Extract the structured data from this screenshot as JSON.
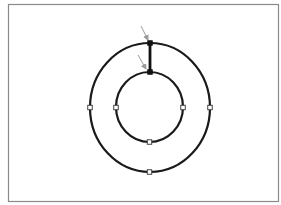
{
  "canvas": {
    "width": 281,
    "height": 205,
    "background": "#ffffff"
  },
  "frame": {
    "x": 8.5,
    "y": 4.5,
    "width": 270,
    "height": 197,
    "stroke": "#8a8a8a",
    "stroke_width": 1.2
  },
  "shapes": {
    "outer_circle": {
      "cx": 150,
      "cy": 107.5,
      "rx": 60,
      "ry": 64.5,
      "stroke": "#1a1a1a",
      "stroke_width": 2.2
    },
    "inner_circle": {
      "cx": 149.5,
      "cy": 107,
      "rx": 33.5,
      "ry": 35,
      "stroke": "#1a1a1a",
      "stroke_width": 2.2
    },
    "connector": {
      "x1": 150,
      "y1": 43,
      "x2": 150,
      "y2": 72,
      "stroke": "#111111",
      "stroke_width": 2.8
    }
  },
  "handles": {
    "size": 4.5,
    "fill": "#ffffff",
    "stroke": "#333333",
    "open": [
      {
        "name": "outer-left-handle",
        "x": 90,
        "y": 107.5
      },
      {
        "name": "outer-right-handle",
        "x": 210,
        "y": 107.5
      },
      {
        "name": "outer-bottom-handle",
        "x": 149.5,
        "y": 172
      },
      {
        "name": "inner-left-handle",
        "x": 116,
        "y": 107.5
      },
      {
        "name": "inner-right-handle",
        "x": 183,
        "y": 107.5
      },
      {
        "name": "inner-bottom-handle",
        "x": 149.5,
        "y": 142
      }
    ],
    "selected": [
      {
        "name": "outer-top-handle",
        "x": 150,
        "y": 43
      },
      {
        "name": "inner-top-handle",
        "x": 150,
        "y": 72
      }
    ],
    "selected_fill": "#111111"
  },
  "arrows": {
    "stroke": "#9a9a9a",
    "stroke_width": 1,
    "items": [
      {
        "name": "outer-top-pointer-arrow",
        "x1": 141,
        "y1": 26,
        "x2": 148,
        "y2": 40
      },
      {
        "name": "inner-top-pointer-arrow",
        "x1": 138,
        "y1": 55,
        "x2": 146,
        "y2": 69
      }
    ]
  }
}
